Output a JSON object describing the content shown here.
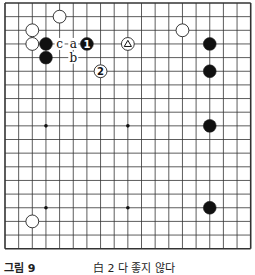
{
  "figure": {
    "caption_label": "그림 9",
    "caption_text": "白 2 다 좋지 않다"
  },
  "board": {
    "size": 19,
    "origin_x": 5,
    "origin_y": 3,
    "spacing": 13.65,
    "line_color": "#333333",
    "star_points": [
      [
        3,
        3
      ],
      [
        9,
        3
      ],
      [
        15,
        3
      ],
      [
        3,
        9
      ],
      [
        9,
        9
      ],
      [
        15,
        9
      ],
      [
        3,
        15
      ],
      [
        9,
        15
      ],
      [
        15,
        15
      ]
    ],
    "stones": [
      {
        "color": "white",
        "col": 4,
        "row": 1
      },
      {
        "color": "white",
        "col": 2,
        "row": 2
      },
      {
        "color": "white",
        "col": 2,
        "row": 3
      },
      {
        "color": "black",
        "col": 3,
        "row": 3
      },
      {
        "color": "black",
        "col": 3,
        "row": 4
      },
      {
        "color": "black",
        "col": 6,
        "row": 3,
        "label": "1"
      },
      {
        "color": "white",
        "col": 7,
        "row": 5,
        "label": "2"
      },
      {
        "color": "white",
        "col": 9,
        "row": 3,
        "mark": "triangle"
      },
      {
        "color": "white",
        "col": 13,
        "row": 2
      },
      {
        "color": "black",
        "col": 15,
        "row": 3
      },
      {
        "color": "black",
        "col": 15,
        "row": 5
      },
      {
        "color": "black",
        "col": 15,
        "row": 9
      },
      {
        "color": "black",
        "col": 15,
        "row": 15
      },
      {
        "color": "white",
        "col": 2,
        "row": 16
      }
    ],
    "letters": [
      {
        "text": "c",
        "col": 4,
        "row": 3
      },
      {
        "text": "a",
        "col": 5,
        "row": 3
      },
      {
        "text": "b",
        "col": 5,
        "row": 4
      }
    ]
  }
}
